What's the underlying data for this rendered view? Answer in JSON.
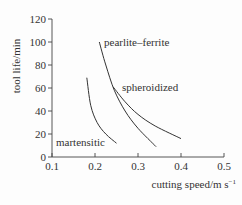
{
  "chart_data": {
    "type": "line",
    "title": "",
    "xlabel": "cutting speed/m s⁻¹",
    "ylabel": "tool life/min",
    "xlim": [
      0.1,
      0.5
    ],
    "ylim": [
      0,
      120
    ],
    "xticks": [
      0.1,
      0.2,
      0.3,
      0.4,
      0.5
    ],
    "xtick_labels": [
      "0.1",
      "0.2",
      "0.3",
      "0.4",
      "0.5"
    ],
    "yticks": [
      0,
      20,
      40,
      60,
      80,
      100,
      120
    ],
    "ytick_labels": [
      "0",
      "20",
      "40",
      "60",
      "80",
      "100",
      "120"
    ],
    "grid": false,
    "legend": "inline labels",
    "series": [
      {
        "name": "pearlite–ferrite",
        "x": [
          0.21,
          0.225,
          0.245,
          0.27,
          0.3,
          0.342
        ],
        "y": [
          100,
          80,
          58,
          40,
          25,
          9
        ]
      },
      {
        "name": "spheroidized",
        "x": [
          0.242,
          0.27,
          0.3,
          0.34,
          0.4
        ],
        "y": [
          61,
          48,
          37,
          27,
          16
        ]
      },
      {
        "name": "martensitic",
        "x": [
          0.181,
          0.19,
          0.205,
          0.225,
          0.25
        ],
        "y": [
          69,
          45,
          30,
          20,
          12
        ]
      }
    ]
  },
  "labels": {
    "ylabel": "tool life/min",
    "xlabel": "cutting speed/m s",
    "xlabel_sup": "−1",
    "series_labels": [
      "pearlite–ferrite",
      "spheroidized",
      "martensitic"
    ]
  }
}
